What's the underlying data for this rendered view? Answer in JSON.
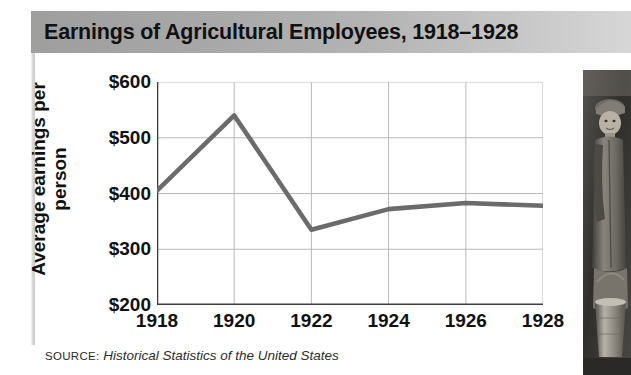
{
  "figure": {
    "title": "Earnings of Agricultural Employees, 1918–1928",
    "source_label": "SOURCE:",
    "source_title": "Historical Statistics of the United States",
    "photo_caption": "photograph of a young agricultural worker holding a metal pail"
  },
  "colors": {
    "title_bar_left": "#9e9e9e",
    "title_bar_right": "#d6d6d6",
    "line": "#6b6b6b",
    "grid": "#b9b9b9",
    "axis": "#3c3c3c",
    "text": "#111111",
    "background": "#ffffff"
  },
  "chart_data": {
    "type": "line",
    "title": "Earnings of Agricultural Employees, 1918–1928",
    "xlabel": "",
    "ylabel": "Average earnings per person",
    "x": [
      1918,
      1919,
      1920,
      1921,
      1922,
      1923,
      1924,
      1925,
      1926,
      1927,
      1928
    ],
    "values": [
      405,
      472,
      540,
      437,
      335,
      354,
      372,
      378,
      383,
      381,
      378
    ],
    "xticks": [
      "1918",
      "1920",
      "1922",
      "1924",
      "1926",
      "1928"
    ],
    "xtick_values": [
      1918,
      1920,
      1922,
      1924,
      1926,
      1928
    ],
    "yticks": [
      "$200",
      "$300",
      "$400",
      "$500",
      "$600"
    ],
    "ytick_values": [
      200,
      300,
      400,
      500,
      600
    ],
    "xlim": [
      1918,
      1928
    ],
    "ylim": [
      200,
      600
    ],
    "grid": true,
    "legend": "none",
    "series": [
      {
        "name": "Average earnings per person",
        "x": [
          1918,
          1920,
          1922,
          1924,
          1926,
          1928
        ],
        "values": [
          405,
          540,
          335,
          372,
          383,
          378
        ]
      }
    ]
  }
}
